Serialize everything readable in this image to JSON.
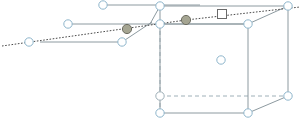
{
  "figure": {
    "width": 302,
    "height": 120,
    "background": "#ffffff"
  },
  "style": {
    "solid_edge_color": "#8d9aa0",
    "hidden_edge_color": "#9fb0b8",
    "dotted_ray_color": "#4a4a4a",
    "node_stroke": "#8fb6cc",
    "node_fill": "#ffffff",
    "filled_node_fill": "#a5a592",
    "filled_node_stroke": "#6d6d62",
    "square_stroke": "#6a6a6a",
    "square_fill": "#ffffff",
    "edge_width": 1,
    "hidden_edge_width": 1,
    "hidden_dash": "4 3",
    "dotted_dash": "1.6 1.6",
    "node_radius": 4.2,
    "filled_node_radius": 4.6,
    "square_size": 9
  },
  "nodes": [
    {
      "id": "cube-top-back-left",
      "label": "",
      "x": 160,
      "y": 6,
      "kind": "open"
    },
    {
      "id": "cube-top-back-right",
      "label": "",
      "x": 288,
      "y": 6,
      "kind": "open"
    },
    {
      "id": "cube-top-front-left",
      "label": "",
      "x": 160,
      "y": 24,
      "kind": "open"
    },
    {
      "id": "cube-top-front-right",
      "label": "",
      "x": 248,
      "y": 24,
      "kind": "open"
    },
    {
      "id": "cube-bottom-back-left",
      "label": "",
      "x": 160,
      "y": 96,
      "kind": "hidden-open"
    },
    {
      "id": "cube-bottom-back-right",
      "label": "",
      "x": 288,
      "y": 96,
      "kind": "open"
    },
    {
      "id": "cube-bottom-front-left",
      "label": "",
      "x": 160,
      "y": 113,
      "kind": "open"
    },
    {
      "id": "cube-bottom-front-right",
      "label": "",
      "x": 248,
      "y": 113,
      "kind": "open"
    },
    {
      "id": "cube-body-center",
      "label": "",
      "x": 221,
      "y": 60,
      "kind": "open"
    },
    {
      "id": "flap-right-face-center",
      "label": "",
      "x": 186,
      "y": 20,
      "kind": "filled"
    },
    {
      "id": "flap-left-face-center",
      "label": "",
      "x": 127,
      "y": 29,
      "kind": "filled"
    },
    {
      "id": "flap-left-top-node",
      "label": "",
      "x": 103,
      "y": 5,
      "kind": "open"
    },
    {
      "id": "flap-left-mid-node",
      "label": "",
      "x": 68,
      "y": 24,
      "kind": "open"
    },
    {
      "id": "flap-left-low-node",
      "label": "",
      "x": 122,
      "y": 42,
      "kind": "open"
    },
    {
      "id": "flap-left-far-node",
      "label": "",
      "x": 29,
      "y": 42,
      "kind": "open"
    }
  ],
  "markers": [
    {
      "id": "square-marker",
      "label": "",
      "x": 222,
      "y": 14,
      "kind": "square"
    }
  ],
  "solid_edges": [
    {
      "id": "cube-top-back-edge",
      "x1": 160,
      "y1": 6,
      "x2": 288,
      "y2": 6
    },
    {
      "id": "cube-top-left-diag",
      "x1": 160,
      "y1": 24,
      "x2": 160,
      "y2": 6
    },
    {
      "id": "cube-top-right-diag",
      "x1": 248,
      "y1": 24,
      "x2": 288,
      "y2": 6
    },
    {
      "id": "cube-top-front-edge",
      "x1": 160,
      "y1": 24,
      "x2": 248,
      "y2": 24
    },
    {
      "id": "cube-left-vertical",
      "x1": 160,
      "y1": 24,
      "x2": 160,
      "y2": 113
    },
    {
      "id": "cube-right-vertical",
      "x1": 248,
      "y1": 24,
      "x2": 248,
      "y2": 113
    },
    {
      "id": "cube-far-right-vert",
      "x1": 288,
      "y1": 6,
      "x2": 288,
      "y2": 96
    },
    {
      "id": "cube-bottom-front-edge",
      "x1": 160,
      "y1": 113,
      "x2": 248,
      "y2": 113
    },
    {
      "id": "cube-bottom-right-diag",
      "x1": 248,
      "y1": 113,
      "x2": 288,
      "y2": 96
    },
    {
      "id": "flap-right-upper-edge",
      "x1": 160,
      "y1": 6,
      "x2": 150,
      "y2": 24
    },
    {
      "id": "flap-right-lower-edge",
      "x1": 150,
      "y1": 24,
      "x2": 160,
      "y2": 24
    },
    {
      "id": "flap-right-top-edge",
      "x1": 160,
      "y1": 24,
      "x2": 248,
      "y2": 24
    },
    {
      "id": "flap-left-top-edge",
      "x1": 103,
      "y1": 5,
      "x2": 200,
      "y2": 5
    },
    {
      "id": "flap-left-mid-edge",
      "x1": 68,
      "y1": 24,
      "x2": 150,
      "y2": 24
    },
    {
      "id": "flap-left-low-edge",
      "x1": 122,
      "y1": 42,
      "x2": 40,
      "y2": 42
    },
    {
      "id": "flap-left-slant-edge",
      "x1": 122,
      "y1": 42,
      "x2": 152,
      "y2": 22
    }
  ],
  "hidden_edges": [
    {
      "id": "hidden-back-vertical",
      "x1": 160,
      "y1": 24,
      "x2": 160,
      "y2": 96
    },
    {
      "id": "hidden-bottom-back",
      "x1": 160,
      "y1": 96,
      "x2": 288,
      "y2": 96
    },
    {
      "id": "hidden-bottom-diag",
      "x1": 160,
      "y1": 96,
      "x2": 160,
      "y2": 113
    }
  ],
  "dotted_rays": [
    {
      "id": "dotted-ray-left",
      "x1": 2,
      "y1": 46,
      "x2": 186,
      "y2": 20
    },
    {
      "id": "dotted-ray-right",
      "x1": 186,
      "y1": 20,
      "x2": 300,
      "y2": 7
    }
  ],
  "legend": {
    "open_node": "vertex node",
    "filled_node": "marked site",
    "square_marker": "probe marker",
    "dotted_ray": "projection ray",
    "hidden_edge": "hidden edge"
  }
}
